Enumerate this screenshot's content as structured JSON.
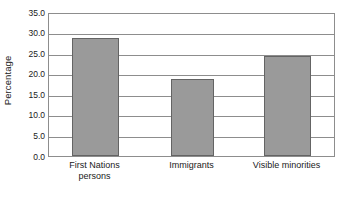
{
  "chart_data": {
    "type": "bar",
    "title": "",
    "xlabel": "",
    "ylabel": "Percentage",
    "categories": [
      "First Nations persons",
      "Immigrants",
      "Visible minorities"
    ],
    "category_lines": [
      [
        "First Nations",
        "persons"
      ],
      [
        "Immigrants"
      ],
      [
        "Visible minorities"
      ]
    ],
    "values": [
      28.8,
      18.6,
      24.2
    ],
    "ylim": [
      0.0,
      35.0
    ],
    "ytick_step": 5.0,
    "ytick_labels": [
      "35.0",
      "30.0",
      "25.0",
      "20.0",
      "15.0",
      "10.0",
      "5.0",
      "0.0"
    ],
    "ytick_values": [
      35.0,
      30.0,
      25.0,
      20.0,
      15.0,
      10.0,
      5.0,
      0.0
    ],
    "grid": true,
    "grid_orientation": "horizontal",
    "legend": false,
    "bar_fill_color": "#9a9a9a",
    "bar_border_color": "#646464",
    "axis_color": "#8d8d8d",
    "background_color": "#ffffff"
  }
}
